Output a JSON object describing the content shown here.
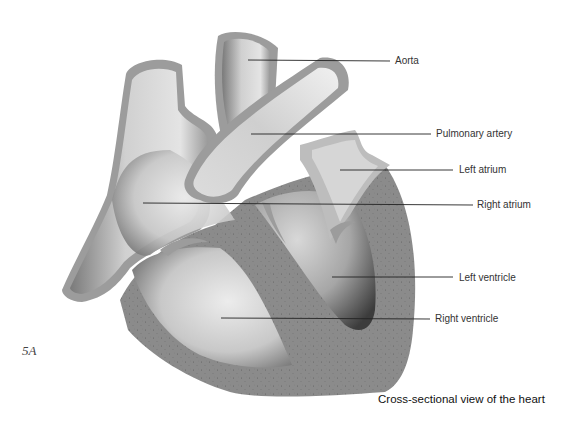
{
  "figure": {
    "number": "5A",
    "caption": "Cross-sectional view of the heart"
  },
  "labels": [
    {
      "id": "aorta",
      "text": "Aorta"
    },
    {
      "id": "pulmonary-artery",
      "text": "Pulmonary artery"
    },
    {
      "id": "left-atrium",
      "text": "Left atrium"
    },
    {
      "id": "right-atrium",
      "text": "Right atrium"
    },
    {
      "id": "left-ventricle",
      "text": "Left ventricle"
    },
    {
      "id": "right-ventricle",
      "text": "Right ventricle"
    }
  ],
  "colors": {
    "muscle": "#8a8a8a",
    "vessel_wall": "#9c9c9c",
    "chamber_light": "#e2e2e2",
    "chamber_dark": "#5a5a5a",
    "leader_line": "#222222"
  }
}
